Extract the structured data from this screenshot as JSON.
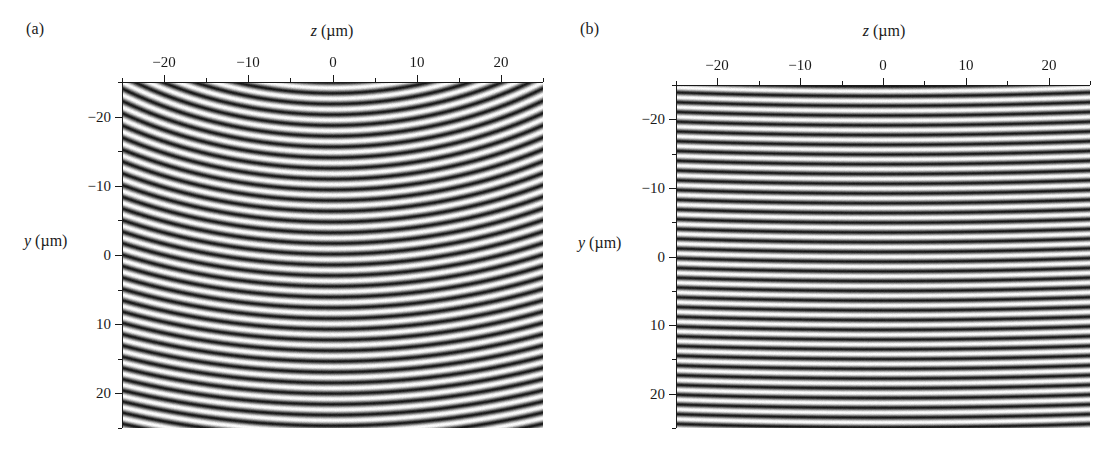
{
  "figure": {
    "width": 1115,
    "height": 458,
    "background": "#ffffff",
    "ink_color": "#1a1a1a"
  },
  "panels": [
    {
      "id": "a",
      "label": "(a)",
      "x_axis": {
        "title_var": "z",
        "title_unit": " (µm)",
        "title": "z (µm)",
        "position": "top",
        "min": -25,
        "max": 25,
        "major_ticks": [
          -20,
          -10,
          0,
          10,
          20
        ],
        "major_tick_labels": [
          "−20",
          "−10",
          "0",
          "10",
          "20"
        ],
        "minor_ticks": [
          -25,
          -15,
          -5,
          5,
          15,
          25
        ]
      },
      "y_axis": {
        "title_var": "y",
        "title_unit": " (µm)",
        "title": "y (µm)",
        "position": "left",
        "min": -25,
        "max": 25,
        "inverted": true,
        "major_ticks": [
          -20,
          -10,
          0,
          10,
          20
        ],
        "major_tick_labels": [
          "−20",
          "−10",
          "0",
          "10",
          "20"
        ],
        "minor_ticks": [
          -25,
          -15,
          -5,
          5,
          15,
          25
        ]
      }
    },
    {
      "id": "b",
      "label": "(b)",
      "x_axis": {
        "title_var": "z",
        "title_unit": " (µm)",
        "title": "z (µm)",
        "position": "top",
        "min": -25,
        "max": 25,
        "major_ticks": [
          -20,
          -10,
          0,
          10,
          20
        ],
        "major_tick_labels": [
          "−20",
          "−10",
          "0",
          "10",
          "20"
        ],
        "minor_ticks": [
          -25,
          -15,
          -5,
          5,
          15,
          25
        ]
      },
      "y_axis": {
        "title_var": "y",
        "title_unit": " (µm)",
        "title": "y (µm)",
        "position": "left",
        "min": -25,
        "max": 25,
        "inverted": true,
        "major_ticks": [
          -20,
          -10,
          0,
          10,
          20
        ],
        "major_tick_labels": [
          "−20",
          "−10",
          "0",
          "10",
          "20"
        ],
        "minor_ticks": [
          -25,
          -15,
          -5,
          5,
          15,
          25
        ]
      }
    }
  ],
  "chart_data": [
    {
      "type": "heatmap",
      "panel": "a",
      "title": "",
      "xlabel": "z (µm)",
      "ylabel": "y (µm)",
      "xlim": [
        -25,
        25
      ],
      "ylim": [
        25,
        -25
      ],
      "grid": false,
      "legend": "none",
      "description": "Interference fringe intensity map with strongly curved concentric arc fringes",
      "pattern": {
        "kind": "concentric-arcs",
        "center_z_um": 0,
        "center_y_um": 66,
        "fringe_period_um": 1.55,
        "phase_offset": 0.0,
        "contrast": 1.0,
        "grayscale_min": "#141414",
        "grayscale_max": "#ffffff",
        "noise_amplitude": 0.1
      }
    },
    {
      "type": "heatmap",
      "panel": "b",
      "title": "",
      "xlabel": "z (µm)",
      "ylabel": "y (µm)",
      "xlim": [
        -25,
        25
      ],
      "ylim": [
        25,
        -25
      ],
      "grid": false,
      "legend": "none",
      "description": "Interference fringe intensity map with nearly flat, evenly spaced horizontal fringes",
      "pattern": {
        "kind": "concentric-arcs",
        "center_z_um": 0,
        "center_y_um": 620,
        "fringe_period_um": 1.42,
        "phase_offset": 0.35,
        "contrast": 1.0,
        "grayscale_min": "#141414",
        "grayscale_max": "#ffffff",
        "noise_amplitude": 0.09
      }
    }
  ],
  "layout": {
    "panel_a": {
      "label_x": 26,
      "label_y": 20,
      "plot_left": 122,
      "plot_top": 82,
      "plot_width": 421,
      "plot_height": 346,
      "x_title_x": 332,
      "x_title_y": 22,
      "y_title_x": 24,
      "y_title_y": 241
    },
    "panel_b": {
      "label_x": 580,
      "label_y": 20,
      "plot_left": 676,
      "plot_top": 85,
      "plot_width": 414,
      "plot_height": 343,
      "x_title_x": 884,
      "x_title_y": 22,
      "y_title_x": 578,
      "y_title_y": 243
    },
    "tick_major_length": 7,
    "tick_minor_length": 4
  }
}
